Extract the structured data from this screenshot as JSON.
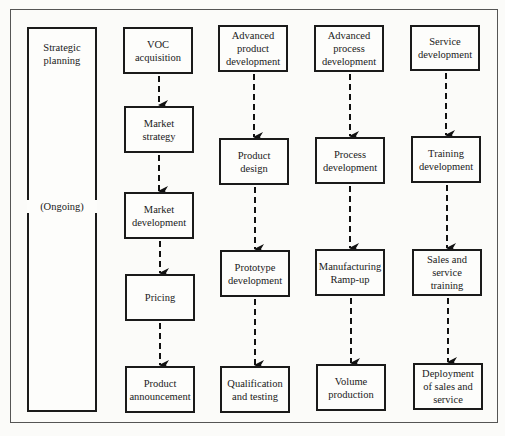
{
  "diagram": {
    "type": "flowchart",
    "strategic": {
      "label": "Strategic\nplanning",
      "note": "(Ongoing)"
    },
    "columns": [
      {
        "name": "marketing",
        "steps": [
          "VOC\nacquisition",
          "Market\nstrategy",
          "Market\ndevelopment",
          "Pricing",
          "Product\nannouncement"
        ]
      },
      {
        "name": "product",
        "steps": [
          "Advanced\nproduct\ndevelopment",
          "Product\ndesign",
          "Prototype\ndevelopment",
          "Qualification\nand testing"
        ]
      },
      {
        "name": "process",
        "steps": [
          "Advanced\nprocess\ndevelopment",
          "Process\ndevelopment",
          "Manufacturing\nRamp-up",
          "Volume\nproduction"
        ]
      },
      {
        "name": "service",
        "steps": [
          "Service\ndevelopment",
          "Training\ndevelopment",
          "Sales and\nservice\ntraining",
          "Deployment\nof sales and\nservice"
        ]
      }
    ],
    "edge_style": "dashed-arrow"
  }
}
